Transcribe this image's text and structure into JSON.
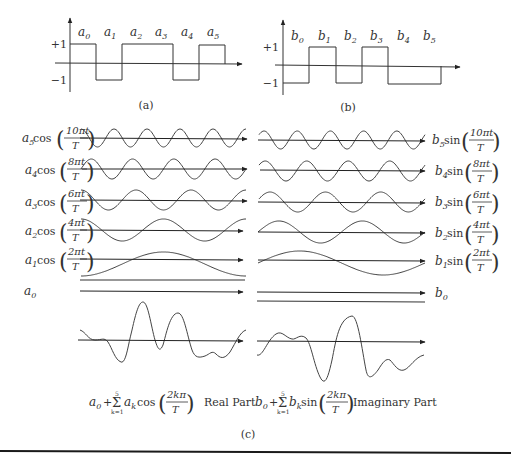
{
  "panel_a": {
    "caption": "(a)",
    "y_ticks": [
      "+1",
      "−1"
    ],
    "segments": [
      {
        "label": "a",
        "sub": "0",
        "value": 1
      },
      {
        "label": "a",
        "sub": "1",
        "value": -1
      },
      {
        "label": "a",
        "sub": "2",
        "value": 1
      },
      {
        "label": "a",
        "sub": "3",
        "value": 1
      },
      {
        "label": "a",
        "sub": "4",
        "value": -1
      },
      {
        "label": "a",
        "sub": "5",
        "value": 1
      }
    ]
  },
  "panel_b": {
    "caption": "(b)",
    "y_ticks": [
      "+1",
      "−1"
    ],
    "segments": [
      {
        "label": "b",
        "sub": "0",
        "value": -1
      },
      {
        "label": "b",
        "sub": "1",
        "value": 1
      },
      {
        "label": "b",
        "sub": "2",
        "value": -1
      },
      {
        "label": "b",
        "sub": "3",
        "value": 1
      },
      {
        "label": "b",
        "sub": "4",
        "value": -1
      },
      {
        "label": "b",
        "sub": "5",
        "value": -1
      }
    ]
  },
  "panel_c": {
    "caption": "(c)",
    "cos_rows": [
      {
        "coef": "a",
        "sub": "5",
        "func": "cos",
        "num": "10πt",
        "den": "T",
        "cycles": 5
      },
      {
        "coef": "a",
        "sub": "4",
        "func": "cos",
        "num": "8πt",
        "den": "T",
        "cycles": 4
      },
      {
        "coef": "a",
        "sub": "3",
        "func": "cos",
        "num": "6πt",
        "den": "T",
        "cycles": 3
      },
      {
        "coef": "a",
        "sub": "2",
        "func": "cos",
        "num": "4πt",
        "den": "T",
        "cycles": 2
      },
      {
        "coef": "a",
        "sub": "1",
        "func": "cos",
        "num": "2πt",
        "den": "T",
        "cycles": 1
      }
    ],
    "sin_rows": [
      {
        "coef": "b",
        "sub": "5",
        "func": "sin",
        "num": "10πt",
        "den": "T",
        "cycles": 5
      },
      {
        "coef": "b",
        "sub": "4",
        "func": "sin",
        "num": "8πt",
        "den": "T",
        "cycles": 4
      },
      {
        "coef": "b",
        "sub": "3",
        "func": "sin",
        "num": "6πt",
        "den": "T",
        "cycles": 3
      },
      {
        "coef": "b",
        "sub": "2",
        "func": "sin",
        "num": "4πt",
        "den": "T",
        "cycles": 2
      },
      {
        "coef": "b",
        "sub": "1",
        "func": "sin",
        "num": "2πt",
        "den": "T",
        "cycles": 1
      }
    ],
    "dc_left": {
      "coef": "a",
      "sub": "0"
    },
    "dc_right": {
      "coef": "b",
      "sub": "0"
    },
    "sum_left": {
      "const": "a",
      "const_sub": "0",
      "plus": "+",
      "sigma": "Σ",
      "upper": "5",
      "lower": "k=1",
      "coef": "a",
      "coef_sub": "k",
      "func": "cos",
      "num": "2kπ",
      "den": "T",
      "label": "Real Part"
    },
    "sum_right": {
      "const": "b",
      "const_sub": "0",
      "plus": "+",
      "sigma": "Σ",
      "upper": "5",
      "lower": "k=1",
      "coef": "b",
      "coef_sub": "k",
      "func": "sin",
      "num": "2kπ",
      "den": "T",
      "label": "Imaginary Part"
    }
  },
  "colors": {
    "ink": "#333333",
    "rule": "#1a1a1a",
    "background": "#ffffff"
  }
}
